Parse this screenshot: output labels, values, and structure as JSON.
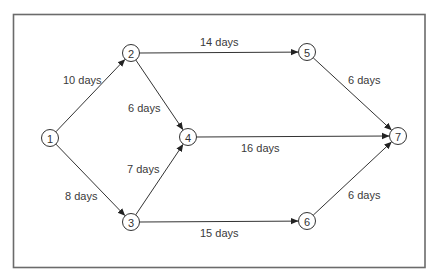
{
  "diagram": {
    "type": "network-activity-diagram",
    "nodes": [
      {
        "id": "1",
        "label": "1"
      },
      {
        "id": "2",
        "label": "2"
      },
      {
        "id": "3",
        "label": "3"
      },
      {
        "id": "4",
        "label": "4"
      },
      {
        "id": "5",
        "label": "5"
      },
      {
        "id": "6",
        "label": "6"
      },
      {
        "id": "7",
        "label": "7"
      }
    ],
    "edges": [
      {
        "from": "1",
        "to": "2",
        "label": "10 days",
        "duration_days": 10
      },
      {
        "from": "1",
        "to": "3",
        "label": "8 days",
        "duration_days": 8
      },
      {
        "from": "2",
        "to": "5",
        "label": "14 days",
        "duration_days": 14
      },
      {
        "from": "2",
        "to": "4",
        "label": "6 days",
        "duration_days": 6
      },
      {
        "from": "3",
        "to": "4",
        "label": "7 days",
        "duration_days": 7
      },
      {
        "from": "3",
        "to": "6",
        "label": "15 days",
        "duration_days": 15
      },
      {
        "from": "4",
        "to": "7",
        "label": "16 days",
        "duration_days": 16
      },
      {
        "from": "5",
        "to": "7",
        "label": "6 days",
        "duration_days": 6
      },
      {
        "from": "6",
        "to": "7",
        "label": "6 days",
        "duration_days": 6
      }
    ]
  }
}
